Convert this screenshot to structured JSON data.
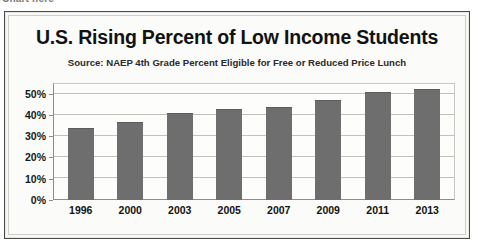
{
  "artifact": {
    "top_cut_text": "Chart here"
  },
  "chart_data": {
    "type": "bar",
    "title": "U.S. Rising Percent of Low Income Students",
    "subtitle": "Source: NAEP 4th Grade Percent Eligible for Free or Reduced Price Lunch",
    "xlabel": "",
    "ylabel": "",
    "categories": [
      "1996",
      "2000",
      "2003",
      "2005",
      "2007",
      "2009",
      "2011",
      "2013"
    ],
    "values": [
      34,
      36.5,
      41,
      43,
      43.5,
      47,
      51,
      52
    ],
    "value_labels": [
      "34%",
      "36.5%",
      "41%",
      "43%",
      "43.5%",
      "47%",
      "51%",
      "52%"
    ],
    "ylim": [
      0,
      55
    ],
    "yticks": [
      0,
      10,
      20,
      30,
      40,
      50
    ],
    "ytick_labels": [
      "0%",
      "10%",
      "20%",
      "30%",
      "40%",
      "50%"
    ],
    "grid": true,
    "legend": false,
    "series": [
      {
        "name": "Percent eligible",
        "values": [
          34,
          36.5,
          41,
          43,
          43.5,
          47,
          51,
          52
        ]
      }
    ],
    "colors": {
      "bar": "#6e6e6e",
      "grid": "#c2c2bd",
      "axis": "#8d8d8d",
      "text": "#121212",
      "plot_background": "#fdfdfb",
      "frame_background": "#f7f7f5",
      "frame_border": "#4a4a4a"
    }
  }
}
